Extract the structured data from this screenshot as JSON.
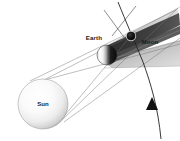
{
  "diagram": {
    "background_color": "#ffffff",
    "width": 180,
    "height": 141,
    "labels": {
      "sun": "Sun",
      "earth": "Earth",
      "moon": "Moon"
    },
    "colors": {
      "umbra": "#3b3b3b",
      "penumbra": "#b9b9b9",
      "penumbra_light": "#d6d6d6",
      "ray_line": "#6b6b6b",
      "orbit_line": "#2a2a2a",
      "sun_light": "#ffffff",
      "sun_shade": "#b5b5b5",
      "earth_lit": "#f2f2f2",
      "earth_dark": "#141414",
      "moon_dark": "#0d0d0d",
      "moon_rim": "#cfcfcf",
      "label_text": "#1a1a1a"
    },
    "bodies": {
      "sun": {
        "cx": 43,
        "cy": 104,
        "r": 25,
        "name": "Sun"
      },
      "earth": {
        "cx": 107,
        "cy": 55,
        "r": 10,
        "name": "Earth"
      },
      "moon": {
        "cx": 131,
        "cy": 36,
        "r": 4.6,
        "name": "Moon"
      }
    },
    "label_positions": {
      "sun": {
        "x": 43,
        "y": 106
      },
      "earth": {
        "x": 94,
        "y": 40
      },
      "moon": {
        "x": 150,
        "y": 44
      }
    },
    "annotations": {
      "orbit_arrow_direction": "upward along moon orbit",
      "shadow_type_umbra": "umbra",
      "shadow_type_penumbra": "penumbra"
    }
  }
}
